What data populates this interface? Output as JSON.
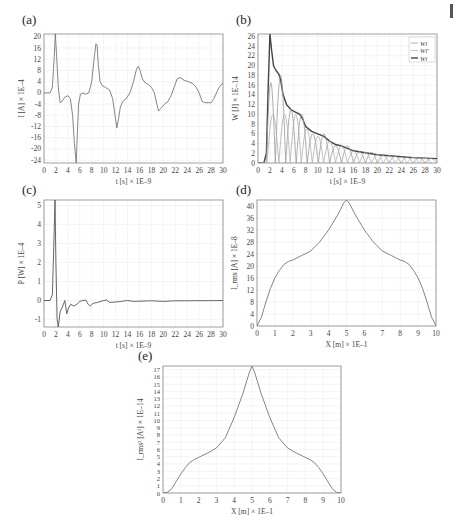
{
  "figure": {
    "panels": [
      "(a)",
      "(b)",
      "(c)",
      "(d)",
      "(e)"
    ]
  },
  "chart_data": [
    {
      "id": "a",
      "panel_label": "(a)",
      "type": "line",
      "title": "",
      "xlabel": "t [s] × 1E–9",
      "ylabel": "I [A] × 1E–4",
      "xlim": [
        0,
        30
      ],
      "ylim": [
        -25,
        21
      ],
      "xticks": [
        0,
        2,
        4,
        6,
        8,
        10,
        12,
        14,
        16,
        18,
        20,
        22,
        24,
        26,
        28,
        30
      ],
      "yticks": [
        -24,
        -20,
        -16,
        -12,
        -8,
        -4,
        0,
        4,
        8,
        12,
        16,
        20
      ],
      "grid": true,
      "series": [
        {
          "name": "I",
          "color": "#777777",
          "x": [
            0,
            1.0,
            1.4,
            1.7,
            1.9,
            2.1,
            2.4,
            2.7,
            3.0,
            3.5,
            4.0,
            4.4,
            4.8,
            5.1,
            5.4,
            5.6,
            5.8,
            6.1,
            6.5,
            7.0,
            7.5,
            8.0,
            8.4,
            8.7,
            8.9,
            9.1,
            9.4,
            9.8,
            10.3,
            11.0,
            11.5,
            11.9,
            12.2,
            12.5,
            12.8,
            13.2,
            13.8,
            14.4,
            15.0,
            15.5,
            15.8,
            16.1,
            16.5,
            17.0,
            17.5,
            18.0,
            18.5,
            18.9,
            19.2,
            19.6,
            20.2,
            20.8,
            21.3,
            21.8,
            22.3,
            22.8,
            23.5,
            24.2,
            24.8,
            25.5,
            26.0,
            26.5,
            27.0,
            27.5,
            28.0,
            28.5,
            29.0,
            29.5,
            30.0
          ],
          "y": [
            0,
            0,
            2,
            12,
            21,
            14,
            2,
            -3.5,
            -3,
            -1.5,
            -1,
            -2,
            -8,
            -18,
            -25,
            -14,
            -4,
            -0.5,
            0,
            -0.5,
            0,
            4,
            12,
            17.5,
            17,
            10,
            4,
            2.5,
            2,
            1,
            -2,
            -8,
            -12.5,
            -9,
            -5,
            -3,
            -2,
            0,
            4,
            8.5,
            9.5,
            8,
            5,
            3.5,
            3,
            2,
            0,
            -4,
            -6.5,
            -5.5,
            -4,
            -3,
            -1,
            2,
            5,
            5.5,
            4.5,
            4,
            3.5,
            2,
            0,
            -3,
            -3.5,
            -3.5,
            -3.5,
            -2,
            0.5,
            2.5,
            3.5
          ]
        }
      ]
    },
    {
      "id": "b",
      "panel_label": "(b)",
      "type": "line",
      "title": "",
      "xlabel": "t [s] × 1E–9",
      "ylabel": "W [J] × 1E–14",
      "xlim": [
        0,
        30
      ],
      "ylim": [
        0,
        26.5
      ],
      "xticks": [
        0,
        2,
        4,
        6,
        8,
        10,
        12,
        14,
        16,
        18,
        20,
        22,
        24,
        26,
        28,
        30
      ],
      "yticks": [
        0,
        2,
        4,
        6,
        8,
        10,
        12,
        14,
        16,
        18,
        20,
        22,
        24,
        26
      ],
      "grid": true,
      "legend": {
        "position": "upper right",
        "entries": [
          "W_l",
          "W_l'",
          "W_t"
        ]
      },
      "series": [
        {
          "name": "W_t (total)",
          "color": "#444444",
          "width": 1.4,
          "x": [
            0,
            1.0,
            1.4,
            1.7,
            2.0,
            2.3,
            2.6,
            3.0,
            3.5,
            3.8,
            4.2,
            4.8,
            5.5,
            6.2,
            7.0,
            7.5,
            8.0,
            9.0,
            10.0,
            11.0,
            12.0,
            13.0,
            14.0,
            15.0,
            16.0,
            17.0,
            18.0,
            19.0,
            20.0,
            21.0,
            22.0,
            24.0,
            26.0,
            28.0,
            30.0
          ],
          "y": [
            0,
            0.1,
            2,
            15,
            26.5,
            23,
            20,
            19,
            18.2,
            17,
            14,
            12,
            11,
            10.5,
            10,
            9,
            7.5,
            6.5,
            6,
            5.5,
            4.5,
            3.8,
            3.5,
            3,
            2.5,
            2.3,
            2.1,
            1.9,
            1.7,
            1.6,
            1.5,
            1.3,
            1.1,
            1.0,
            0.9
          ]
        },
        {
          "name": "W_l (inductive)",
          "color": "#9a9a9a",
          "width": 0.8,
          "oscillating": true,
          "peaks_x": [
            2.0,
            3.8,
            5.5,
            7.3,
            9.2,
            11.0,
            13.0,
            15.0,
            17.0,
            19.0,
            21.0,
            23.0,
            25.0,
            27.0,
            29.0
          ],
          "peaks_y": [
            16.5,
            18,
            11,
            10,
            6,
            6,
            3.5,
            3.5,
            2.3,
            2.2,
            1.5,
            1.4,
            1.1,
            1.0,
            0.9
          ],
          "phase": 0
        },
        {
          "name": "W_l' (capacitive)",
          "color": "#b0b0b0",
          "width": 0.8,
          "oscillating": true,
          "peaks_x": [
            2.5,
            4.5,
            6.3,
            8.2,
            10.0,
            12.0,
            14.0,
            16.0,
            18.0,
            20.0,
            22.0,
            24.0,
            26.0,
            28.0
          ],
          "peaks_y": [
            10,
            10,
            10,
            7,
            5.5,
            4.5,
            3.5,
            2.5,
            2.2,
            1.7,
            1.5,
            1.2,
            1.1,
            1.0
          ],
          "phase": 1
        }
      ]
    },
    {
      "id": "c",
      "panel_label": "(c)",
      "type": "line",
      "title": "",
      "xlabel": "t [s] × 1E–9",
      "ylabel": "P [W] × 1E–4",
      "xlim": [
        0,
        30
      ],
      "ylim": [
        -1.4,
        5.3
      ],
      "xticks": [
        0,
        2,
        4,
        6,
        8,
        10,
        12,
        14,
        16,
        18,
        20,
        22,
        24,
        26,
        28,
        30
      ],
      "yticks": [
        -1,
        0,
        1,
        2,
        3,
        4,
        5
      ],
      "grid": true,
      "series": [
        {
          "name": "P",
          "color": "#555555",
          "x": [
            0,
            1.0,
            1.4,
            1.7,
            1.85,
            2.0,
            2.2,
            2.4,
            2.7,
            3.0,
            3.5,
            3.8,
            4.1,
            4.5,
            5.0,
            5.5,
            6.0,
            6.5,
            7.0,
            7.4,
            7.8,
            8.2,
            9.0,
            10.0,
            10.5,
            11.0,
            12.0,
            13.0,
            14.0,
            15.0,
            16.0,
            18.0,
            20.0,
            22.0,
            24.0,
            26.0,
            28.0,
            30.0
          ],
          "y": [
            0,
            0,
            0.3,
            3.5,
            5.3,
            2.0,
            -1.0,
            -1.4,
            -0.6,
            -0.4,
            0,
            -0.7,
            -0.4,
            -0.2,
            -0.3,
            -0.2,
            -0.05,
            0,
            0.02,
            -0.2,
            -0.3,
            -0.15,
            -0.1,
            0,
            0.02,
            -0.1,
            -0.08,
            -0.05,
            0,
            -0.05,
            -0.04,
            -0.02,
            -0.05,
            -0.02,
            -0.02,
            -0.01,
            -0.01,
            0
          ]
        }
      ]
    },
    {
      "id": "d",
      "panel_label": "(d)",
      "type": "line",
      "title": "",
      "xlabel": "X [m] × 1E–1",
      "ylabel": "I_rms [A] × 1E–8",
      "xlim": [
        0,
        10
      ],
      "ylim": [
        0,
        42
      ],
      "xticks": [
        0,
        1,
        2,
        3,
        4,
        5,
        6,
        7,
        8,
        9,
        10
      ],
      "yticks": [
        0,
        4,
        8,
        12,
        16,
        20,
        24,
        28,
        32,
        36,
        40
      ],
      "grid": true,
      "series": [
        {
          "name": "I_rms",
          "color": "#777777",
          "x": [
            0,
            0.25,
            0.5,
            0.75,
            1.0,
            1.25,
            1.5,
            1.75,
            2.0,
            2.5,
            3.0,
            3.5,
            4.0,
            4.5,
            4.85,
            5.0,
            5.15,
            5.5,
            6.0,
            6.5,
            7.0,
            7.5,
            8.0,
            8.25,
            8.5,
            8.75,
            9.0,
            9.25,
            9.5,
            9.75,
            10.0
          ],
          "y": [
            0,
            3,
            8,
            12.5,
            16,
            18.5,
            20.5,
            21.5,
            22,
            23.5,
            25,
            28,
            32,
            37,
            41,
            42,
            41,
            37,
            32,
            28,
            25,
            23.5,
            22,
            21.5,
            20.5,
            18.5,
            16,
            12.5,
            8,
            3,
            0
          ]
        }
      ]
    },
    {
      "id": "e",
      "panel_label": "(e)",
      "type": "line",
      "title": "",
      "xlabel": "X [m] × 1E–1",
      "ylabel": "I_rms² [A²] × 1E–14",
      "xlim": [
        0,
        10
      ],
      "ylim": [
        0,
        17.5
      ],
      "xticks": [
        0,
        1,
        2,
        3,
        4,
        5,
        6,
        7,
        8,
        9,
        10
      ],
      "yticks": [
        0,
        1,
        2,
        3,
        4,
        5,
        6,
        7,
        8,
        9,
        10,
        11,
        12,
        13,
        14,
        15,
        16,
        17
      ],
      "grid": true,
      "series": [
        {
          "name": "I_rms^2",
          "color": "#777777",
          "x": [
            0,
            0.25,
            0.5,
            0.75,
            1.0,
            1.25,
            1.5,
            1.75,
            2.0,
            2.5,
            3.0,
            3.5,
            4.0,
            4.5,
            4.85,
            5.0,
            5.15,
            5.5,
            6.0,
            6.5,
            7.0,
            7.5,
            8.0,
            8.25,
            8.5,
            8.75,
            9.0,
            9.25,
            9.5,
            9.75,
            10.0
          ],
          "y": [
            0,
            0.1,
            0.6,
            1.6,
            2.6,
            3.5,
            4.2,
            4.6,
            4.9,
            5.5,
            6.2,
            7.6,
            10.4,
            13.8,
            16.6,
            17.5,
            16.6,
            13.8,
            10.4,
            7.6,
            6.2,
            5.5,
            4.9,
            4.6,
            4.2,
            3.5,
            2.6,
            1.6,
            0.6,
            0.1,
            0
          ]
        }
      ]
    }
  ]
}
